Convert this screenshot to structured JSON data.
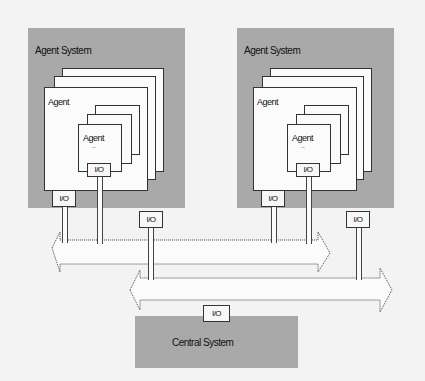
{
  "diagram": {
    "left_system": {
      "title": "Agent System",
      "agent_label": "Agent",
      "sub_agent_label": "Agent",
      "sub_agent_dots": "...",
      "io_inner": "I/O",
      "io_outer": "I/O"
    },
    "right_system": {
      "title": "Agent System",
      "agent_label": "Agent",
      "sub_agent_label": "Agent",
      "sub_agent_dots": "...",
      "io_inner": "I/O",
      "io_outer": "I/O"
    },
    "bus_io_left": "I/O",
    "bus_io_right": "I/O",
    "central_system": {
      "title": "Central System",
      "io": "I/O"
    }
  }
}
